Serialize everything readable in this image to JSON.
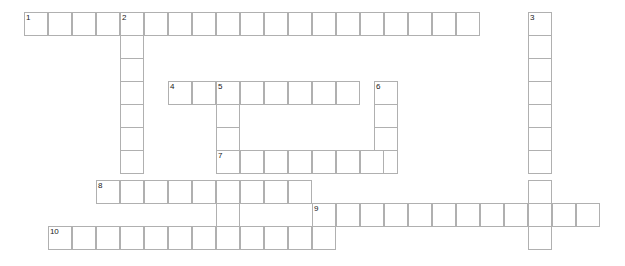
{
  "puzzle": {
    "title": "Crossword Puzzle Grid",
    "cell_size": 24,
    "origin_x": 24,
    "origin_y": 12,
    "colors": {
      "cell_border": "#b0b0b0",
      "cell_fill": "#ffffff",
      "number_text": "#1a1a1a",
      "page_background": "#ffffff"
    },
    "entries": [
      {
        "number": "1",
        "direction": "across",
        "start_col": 0,
        "start_row": 0,
        "length": 19,
        "value": ""
      },
      {
        "number": "2",
        "direction": "down",
        "start_col": 4,
        "start_row": 0,
        "length": 8,
        "value": ""
      },
      {
        "number": "3",
        "direction": "down",
        "start_col": 21,
        "start_row": 0,
        "length": 10,
        "value": ""
      },
      {
        "number": "4",
        "direction": "across",
        "start_col": 6,
        "start_row": 3,
        "length": 8,
        "value": ""
      },
      {
        "number": "5",
        "direction": "down",
        "start_col": 8,
        "start_row": 3,
        "length": 7,
        "value": ""
      },
      {
        "number": "6",
        "direction": "down",
        "start_col": 14,
        "start_row": 3,
        "length": 4,
        "value": ""
      },
      {
        "number": "7",
        "direction": "across",
        "start_col": 8,
        "start_row": 6,
        "length": 7,
        "value": ""
      },
      {
        "number": "8",
        "direction": "across",
        "start_col": 3,
        "start_row": 7,
        "length": 9,
        "value": ""
      },
      {
        "number": "9",
        "direction": "across",
        "start_col": 12,
        "start_row": 8,
        "length": 12,
        "value": ""
      },
      {
        "number": "10",
        "direction": "across",
        "start_col": 1,
        "start_row": 9,
        "length": 12,
        "value": ""
      }
    ],
    "row_offsets": [
      0,
      23,
      46,
      69,
      92,
      115,
      138,
      168,
      191,
      214
    ],
    "column_overrides": {
      "6": {
        "x": 374
      }
    }
  }
}
